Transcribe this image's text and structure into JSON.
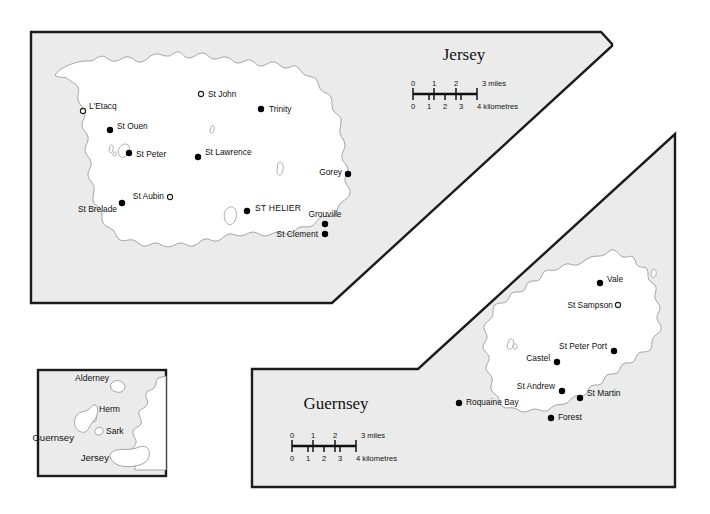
{
  "document": {
    "kind": "map-figure",
    "subject": "Channel Islands",
    "background_color": "#ffffff",
    "panel_fill_color": "#ebebeb",
    "land_fill_color": "#ffffff",
    "border_color": "#1b1b1b"
  },
  "panels": {
    "jersey": {
      "title": "Jersey",
      "scale": {
        "miles_label": "3 miles",
        "miles_ticks": [
          "0",
          "1",
          "2",
          "3"
        ],
        "km_label": "4 kilometres",
        "km_ticks": [
          "0",
          "1",
          "2",
          "3",
          "4"
        ]
      },
      "places": [
        {
          "name": "St John",
          "marker": "open",
          "anchor": "left"
        },
        {
          "name": "Trinity",
          "marker": "filled",
          "anchor": "left"
        },
        {
          "name": "L'Etacq",
          "marker": "open",
          "anchor": "left"
        },
        {
          "name": "St Ouen",
          "marker": "filled",
          "anchor": "left"
        },
        {
          "name": "St Peter",
          "marker": "filled",
          "anchor": "left"
        },
        {
          "name": "St Lawrence",
          "marker": "filled",
          "anchor": "left"
        },
        {
          "name": "Gorey",
          "marker": "filled",
          "anchor": "right"
        },
        {
          "name": "St Aubin",
          "marker": "open",
          "anchor": "right"
        },
        {
          "name": "St Brelade",
          "marker": "filled",
          "anchor": "right"
        },
        {
          "name": "ST HELIER",
          "marker": "filled",
          "anchor": "left"
        },
        {
          "name": "Grouville",
          "marker": "filled",
          "anchor": "above"
        },
        {
          "name": "St Clement",
          "marker": "filled",
          "anchor": "right"
        }
      ]
    },
    "guernsey": {
      "title": "Guernsey",
      "scale": {
        "miles_label": "3 miles",
        "miles_ticks": [
          "0",
          "1",
          "2",
          "3"
        ],
        "km_label": "4 kilometres",
        "km_ticks": [
          "0",
          "1",
          "2",
          "3",
          "4"
        ]
      },
      "places": [
        {
          "name": "Vale",
          "marker": "filled",
          "anchor": "left"
        },
        {
          "name": "St Sampson",
          "marker": "open",
          "anchor": "right"
        },
        {
          "name": "St Peter Port",
          "marker": "filled",
          "anchor": "right"
        },
        {
          "name": "Castel",
          "marker": "filled",
          "anchor": "right"
        },
        {
          "name": "St Andrew",
          "marker": "filled",
          "anchor": "right"
        },
        {
          "name": "St Martin",
          "marker": "filled",
          "anchor": "above"
        },
        {
          "name": "Roquaine Bay",
          "marker": "filled",
          "anchor": "left"
        },
        {
          "name": "Forest",
          "marker": "filled",
          "anchor": "left"
        }
      ]
    },
    "inset": {
      "labels": [
        {
          "name": "Alderney"
        },
        {
          "name": "Herm"
        },
        {
          "name": "Sark"
        },
        {
          "name": "Guernsey"
        },
        {
          "name": "Jersey"
        }
      ]
    }
  }
}
